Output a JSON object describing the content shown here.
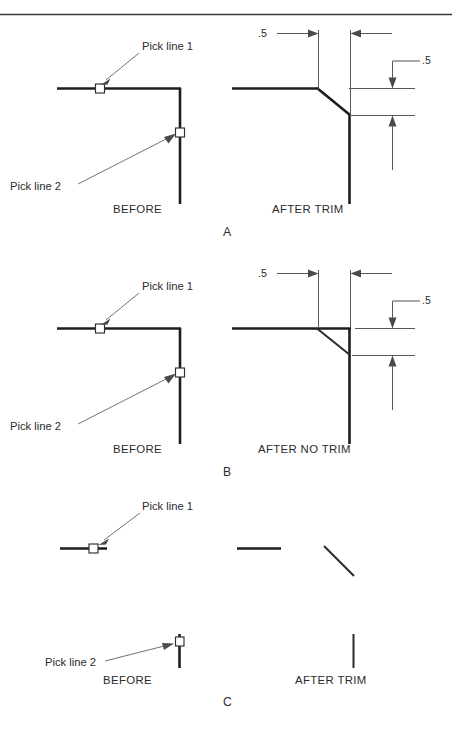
{
  "figure": {
    "panels": [
      {
        "id": "A",
        "label": "A",
        "before_caption": "BEFORE",
        "after_caption": "AFTER TRIM",
        "pick_labels": [
          "Pick line 1",
          "Pick line 2"
        ],
        "dimensions": [
          {
            "value": ".5",
            "orientation": "horizontal"
          },
          {
            "value": ".5",
            "orientation": "vertical"
          }
        ]
      },
      {
        "id": "B",
        "label": "B",
        "before_caption": "BEFORE",
        "after_caption": "AFTER NO TRIM",
        "pick_labels": [
          "Pick line 1",
          "Pick line 2"
        ],
        "dimensions": [
          {
            "value": ".5",
            "orientation": "horizontal"
          },
          {
            "value": ".5",
            "orientation": "vertical"
          }
        ]
      },
      {
        "id": "C",
        "label": "C",
        "before_caption": "BEFORE",
        "after_caption": "AFTER TRIM",
        "pick_labels": [
          "Pick line 1",
          "Pick line 2"
        ],
        "dimensions": []
      }
    ]
  },
  "colors": {
    "object_line": "#1d1d1d",
    "dimension_line": "#58585a",
    "leader_line": "#6a6a6c",
    "text": "#2b2b2d",
    "background": "#ffffff",
    "rule": "#3c3c3e"
  },
  "panelA": {
    "pick1": "Pick line 1",
    "pick2": "Pick line 2",
    "before": "BEFORE",
    "after": "AFTER TRIM",
    "dim_h": ".5",
    "dim_v": ".5",
    "letter": "A"
  },
  "panelB": {
    "pick1": "Pick line 1",
    "pick2": "Pick line 2",
    "before": "BEFORE",
    "after": "AFTER NO TRIM",
    "dim_h": ".5",
    "dim_v": ".5",
    "letter": "B"
  },
  "panelC": {
    "pick1": "Pick line 1",
    "pick2": "Pick line 2",
    "before": "BEFORE",
    "after": "AFTER TRIM",
    "letter": "C"
  }
}
